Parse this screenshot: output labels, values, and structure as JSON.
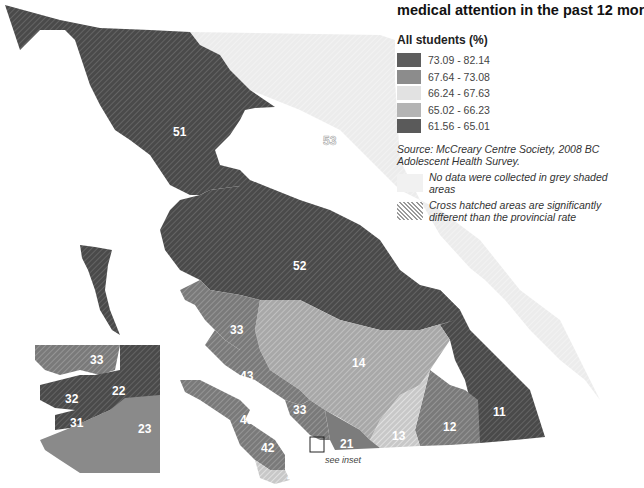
{
  "title": "medical attention in the past 12 mor",
  "legend": {
    "heading": "All students (%)",
    "classes": [
      {
        "range": "73.09 - 82.14",
        "color": "#5e5e5e"
      },
      {
        "range": "67.64 - 73.08",
        "color": "#8c8c8c"
      },
      {
        "range": "66.24 - 67.63",
        "color": "#e2e2e2"
      },
      {
        "range": "65.02 - 66.23",
        "color": "#b4b4b4"
      },
      {
        "range": "61.56 - 65.01",
        "color": "#5a5a5a"
      }
    ],
    "source": "Source: McCreary Centre Society, 2008 BC Adolescent Health Survey.",
    "notes": [
      {
        "type": "no-data",
        "text": "No data were collected in grey shaded areas"
      },
      {
        "type": "cross-hatch",
        "text": "Cross hatched areas are significantly different than the provincial rate"
      }
    ]
  },
  "map": {
    "regions": [
      {
        "id": "51",
        "label": "51",
        "class": "73.09 - 82.14",
        "hatched": true
      },
      {
        "id": "52",
        "label": "52",
        "class": "73.09 - 82.14",
        "hatched": true
      },
      {
        "id": "53",
        "label": "53",
        "class": "no data",
        "hatched": false
      },
      {
        "id": "33",
        "label": "33",
        "class": "67.64 - 73.08",
        "hatched": true
      },
      {
        "id": "43",
        "label": "43",
        "class": "67.64 - 73.08",
        "hatched": true
      },
      {
        "id": "42",
        "label": "42",
        "class": "67.64 - 73.08",
        "hatched": true
      },
      {
        "id": "41",
        "label": "41",
        "class": "66.24 - 67.63",
        "hatched": true
      },
      {
        "id": "14",
        "label": "14",
        "class": "65.02 - 66.23",
        "hatched": true
      },
      {
        "id": "13",
        "label": "13",
        "class": "66.24 - 67.63",
        "hatched": true
      },
      {
        "id": "12",
        "label": "12",
        "class": "67.64 - 73.08",
        "hatched": true
      },
      {
        "id": "11",
        "label": "11",
        "class": "61.56 - 65.01",
        "hatched": true
      },
      {
        "id": "21",
        "label": "21",
        "class": "67.64 - 73.08",
        "hatched": false
      }
    ],
    "inset": {
      "regions": [
        {
          "id": "33",
          "label": "33"
        },
        {
          "id": "22",
          "label": "22"
        },
        {
          "id": "32",
          "label": "32"
        },
        {
          "id": "31",
          "label": "31"
        },
        {
          "id": "23",
          "label": "23"
        }
      ],
      "note": "see inset"
    }
  }
}
